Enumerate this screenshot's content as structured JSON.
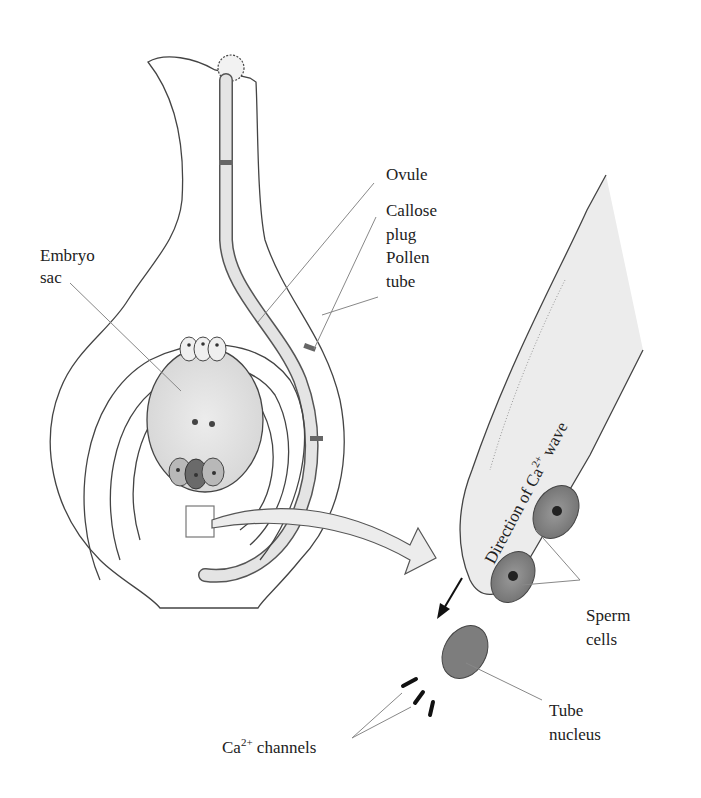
{
  "figure": {
    "labels": {
      "embryo_sac": [
        "Embryo",
        "sac"
      ],
      "ovule": "Ovule",
      "callose_plug": [
        "Callose",
        "plug"
      ],
      "pollen_tube": [
        "Pollen",
        "tube"
      ],
      "direction": {
        "prefix": "Direction of Ca",
        "sup": "2+",
        "suffix": " wave"
      },
      "sperm_cells": [
        "Sperm",
        "cells"
      ],
      "tube_nucleus": [
        "Tube",
        "nucleus"
      ],
      "ca_channels": {
        "prefix": "Ca",
        "sup": "2+",
        "suffix": " channels"
      }
    },
    "colors": {
      "tissue": "#ececec",
      "embryo_sac": "#e2e2e2",
      "outline": "#444444",
      "egg_cell": "#6a6a6a",
      "synergid": "#b8b8b8",
      "sperm": "#8a8a8a",
      "nucleus": "#7d7d7d",
      "leader": "#888888",
      "channel": "#111111"
    }
  }
}
